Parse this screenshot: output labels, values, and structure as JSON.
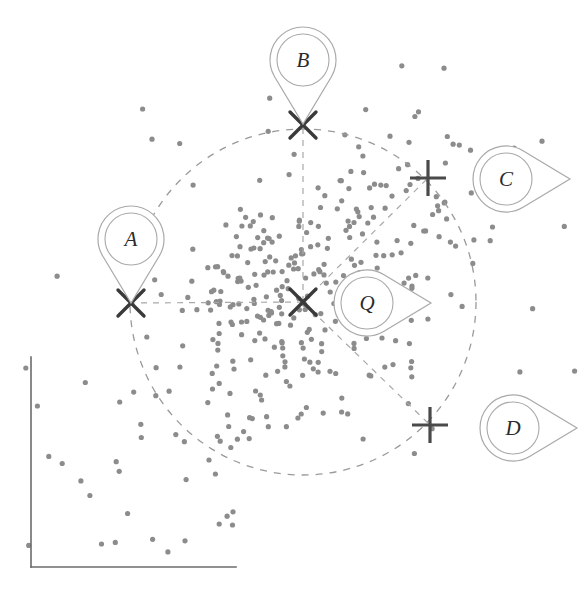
{
  "figure": {
    "title": "",
    "background_color": "#ffffff",
    "width": 584,
    "height": 598
  },
  "axes": {
    "name": "plot-axes",
    "color": "#6b6b6b",
    "stroke_width": 1.6,
    "x_axis": {
      "x1": 31,
      "y1": 567,
      "x2": 236,
      "y2": 567
    },
    "y_axis": {
      "x1": 31,
      "y1": 357,
      "x2": 31,
      "y2": 567
    },
    "x_tick_labels": [],
    "y_tick_labels": []
  },
  "query": {
    "label": "Q",
    "center_x": 303,
    "center_y": 302,
    "marker": "cross-x",
    "marker_color": "#3a3a3a"
  },
  "search_radius": {
    "name": "search-circle",
    "center_x": 303,
    "center_y": 302,
    "radius": 173,
    "style": "dashed",
    "color": "#9a9a9a",
    "dash": "7 7"
  },
  "candidates": [
    {
      "label": "A",
      "marker": "cross-x",
      "x": 131,
      "y": 303,
      "pin_x": 131,
      "pin_y": 239,
      "pin_rotation": 0,
      "inside_radius": true,
      "connector": {
        "x1": 303,
        "y1": 302,
        "x2": 131,
        "y2": 303
      }
    },
    {
      "label": "B",
      "marker": "cross-x",
      "x": 303,
      "y": 125,
      "pin_x": 303,
      "pin_y": 60,
      "pin_rotation": 0,
      "inside_radius": true,
      "connector": {
        "x1": 303,
        "y1": 302,
        "x2": 303,
        "y2": 125
      }
    },
    {
      "label": "C",
      "marker": "plus",
      "x": 428,
      "y": 178,
      "pin_x": 506,
      "pin_y": 179,
      "pin_rotation": -90,
      "inside_radius": false,
      "connector": {
        "x1": 303,
        "y1": 302,
        "x2": 428,
        "y2": 178
      }
    },
    {
      "label": "D",
      "marker": "plus",
      "x": 430,
      "y": 425,
      "pin_x": 513,
      "pin_y": 428,
      "pin_rotation": -90,
      "inside_radius": false,
      "connector": {
        "x1": 303,
        "y1": 302,
        "x2": 430,
        "y2": 425
      }
    }
  ],
  "query_pin": {
    "label": "Q",
    "pin_x": 367,
    "pin_y": 303,
    "pin_rotation": -90
  },
  "markers": {
    "x_color": "#3a3a3a",
    "x_stroke": 3.4,
    "x_size": 13,
    "plus_color": "#4a4a4a",
    "plus_stroke": 3.2,
    "plus_size": 18,
    "connector_color": "#a8a8a8",
    "connector_dash": "6 6",
    "pin_stroke": "#a9a9a9"
  },
  "chart_data": {
    "type": "scatter",
    "title": "",
    "xlabel": "",
    "ylabel": "",
    "point_color": "#8c8c8c",
    "point_radius": 2.6,
    "n_points": 392,
    "clusters": [
      {
        "name": "dense-core",
        "cx": 300,
        "cy": 300,
        "sx": 62,
        "sy": 58,
        "n": 230
      },
      {
        "name": "upper-right-tail",
        "cx": 395,
        "cy": 200,
        "sx": 55,
        "sy": 60,
        "n": 70
      },
      {
        "name": "lower-left-sparse",
        "cx": 175,
        "cy": 430,
        "sx": 78,
        "sy": 72,
        "n": 55
      },
      {
        "name": "outlier-halo",
        "cx": 320,
        "cy": 300,
        "sx": 160,
        "sy": 150,
        "n": 37
      }
    ],
    "legend": [],
    "annotations": [
      "A",
      "B",
      "C",
      "D",
      "Q"
    ]
  }
}
